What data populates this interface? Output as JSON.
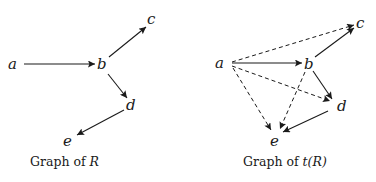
{
  "graphs": [
    {
      "caption_prefix": "Graph of ",
      "caption_var": "R",
      "caption_suffix": "",
      "nodes": {
        "a": "a",
        "b": "b",
        "c": "c",
        "d": "d",
        "e": "e"
      },
      "edges": [
        {
          "from": "a",
          "to": "b",
          "style": "solid"
        },
        {
          "from": "b",
          "to": "c",
          "style": "solid"
        },
        {
          "from": "b",
          "to": "d",
          "style": "solid"
        },
        {
          "from": "d",
          "to": "e",
          "style": "solid"
        }
      ]
    },
    {
      "caption_prefix": "Graph of ",
      "caption_var": "t(R)",
      "caption_suffix": "",
      "nodes": {
        "a": "a",
        "b": "b",
        "c": "c",
        "d": "d",
        "e": "e"
      },
      "edges": [
        {
          "from": "a",
          "to": "b",
          "style": "solid"
        },
        {
          "from": "b",
          "to": "c",
          "style": "solid"
        },
        {
          "from": "b",
          "to": "d",
          "style": "solid"
        },
        {
          "from": "d",
          "to": "e",
          "style": "solid"
        },
        {
          "from": "a",
          "to": "c",
          "style": "dashed"
        },
        {
          "from": "a",
          "to": "d",
          "style": "dashed"
        },
        {
          "from": "a",
          "to": "e",
          "style": "dashed"
        },
        {
          "from": "b",
          "to": "e",
          "style": "dashed"
        }
      ]
    }
  ]
}
